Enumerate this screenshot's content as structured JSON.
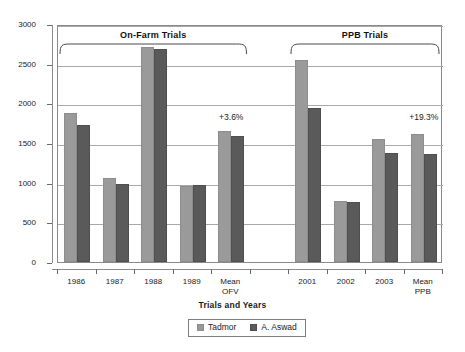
{
  "chart_data": {
    "type": "bar",
    "title": "",
    "xlabel": "Trials and Years",
    "ylabel": "kg/ha",
    "ylim": [
      0,
      3000
    ],
    "ytick_values": [
      0,
      500,
      1000,
      1500,
      2000,
      2500,
      3000
    ],
    "ytick_labels": [
      "0",
      "500",
      "1000",
      "1500",
      "2000",
      "2500",
      "3000"
    ],
    "grid": true,
    "legend_position": "bottom",
    "categories": [
      "1986",
      "1987",
      "1988",
      "1989",
      "Mean\nOFV",
      "",
      "2001",
      "2002",
      "2003",
      "Mean\nPPB"
    ],
    "series": [
      {
        "name": "Tadmor",
        "color": "#9a9a9a",
        "values": [
          1880,
          1055,
          2710,
          955,
          1650,
          null,
          2545,
          765,
          1550,
          1615
        ]
      },
      {
        "name": "A. Aswad",
        "color": "#5a5a5a",
        "values": [
          1730,
          985,
          2680,
          965,
          1590,
          null,
          1945,
          755,
          1370,
          1360
        ]
      }
    ],
    "group_brackets": [
      {
        "label": "On-Farm Trials",
        "from_category": "1986",
        "to_category": "Mean\nOFV"
      },
      {
        "label": "PPB Trials",
        "from_category": "2001",
        "to_category": "Mean\nPPB"
      }
    ],
    "annotations": [
      {
        "text": "+3.6%",
        "at_category": "Mean\nOFV",
        "value": 1840
      },
      {
        "text": "+19.3%",
        "at_category": "Mean\nPPB",
        "value": 1840
      }
    ]
  }
}
